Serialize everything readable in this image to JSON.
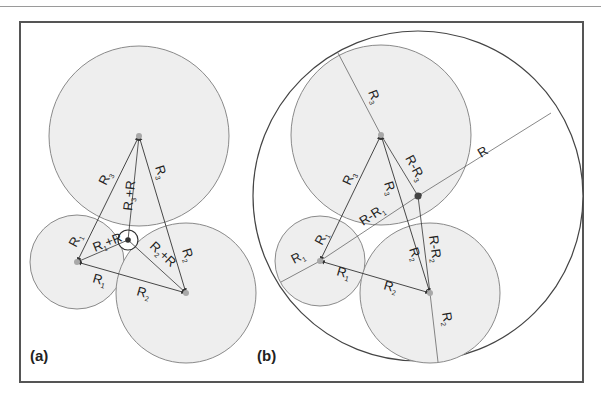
{
  "figure": {
    "panels": [
      {
        "id": "a",
        "label": "(a)",
        "circles": [
          {
            "name": "circle-3",
            "cx": 139,
            "cy": 136,
            "r": 90,
            "label": "R3"
          },
          {
            "name": "circle-1",
            "cx": 77,
            "cy": 262,
            "r": 47,
            "label": "R1"
          },
          {
            "name": "circle-2",
            "cx": 186,
            "cy": 293,
            "r": 70,
            "label": "R2"
          },
          {
            "name": "inner-circle",
            "cx": 128,
            "cy": 240,
            "r": 10,
            "label": "R"
          }
        ],
        "labels": {
          "r3_left": "R",
          "r3_left_sub": "3",
          "r3_right": "R",
          "r3_right_sub": "3",
          "r3_plus_r": "R",
          "r3_plus_r_sub": "3",
          "r3_plus_r_tail": "+R",
          "r1_upper": "R",
          "r1_upper_sub": "1",
          "r1_plus_r": "R",
          "r1_plus_r_sub": "1",
          "r1_plus_r_tail": "+R",
          "r2_plus_r": "R",
          "r2_plus_r_sub": "2",
          "r2_plus_r_tail": "+R",
          "r2_right": "R",
          "r2_right_sub": "2",
          "r1_bottom": "R",
          "r1_bottom_sub": "1",
          "r2_bottom": "R",
          "r2_bottom_sub": "2"
        }
      },
      {
        "id": "b",
        "label": "(b)",
        "circles": [
          {
            "name": "outer-circle",
            "cx": 418,
            "cy": 196,
            "r": 165,
            "label": "R"
          },
          {
            "name": "circle-3",
            "cx": 381,
            "cy": 135,
            "r": 90,
            "label": "R3"
          },
          {
            "name": "circle-1",
            "cx": 320,
            "cy": 261,
            "r": 45,
            "label": "R1"
          },
          {
            "name": "circle-2",
            "cx": 430,
            "cy": 293,
            "r": 70,
            "label": "R2"
          }
        ],
        "labels": {
          "r3_top": "R",
          "r3_top_sub": "3",
          "r3_left": "R",
          "r3_left_sub": "3",
          "r3_mid": "R",
          "r3_mid_sub": "3",
          "r_minus_r3": "R-R",
          "r_minus_r3_sub": "3",
          "r_outer": "R",
          "r_minus_r1": "R-R",
          "r_minus_r1_sub": "1",
          "r1_upper": "R",
          "r1_upper_sub": "1",
          "r1_left": "R",
          "r1_left_sub": "1",
          "r1_bottom": "R",
          "r1_bottom_sub": "1",
          "r2_mid": "R",
          "r2_mid_sub": "2",
          "r_minus_r2": "R-R",
          "r_minus_r2_sub": "2",
          "r2_bottom": "R",
          "r2_bottom_sub": "2",
          "r2_lower_right": "R",
          "r2_lower_right_sub": "2"
        }
      }
    ],
    "colors": {
      "circle_fill": "#eeeeee",
      "circle_stroke": "#8a8a8a",
      "outer_stroke": "#444444",
      "line": "#333333",
      "center_dot": "#a8a8a8",
      "inner_center": "#333333",
      "frame": "#555555"
    }
  }
}
